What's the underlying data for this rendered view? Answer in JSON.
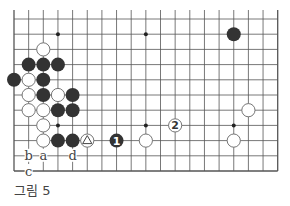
{
  "figure": {
    "caption": "그림 5",
    "board": {
      "columns": 19,
      "rows": 11,
      "edges": [
        "left",
        "bottom",
        "right"
      ],
      "line_color": "#555555",
      "black_color": "#333333",
      "white_fill": "#ffffff",
      "star_points": [
        [
          3,
          1
        ],
        [
          9,
          1
        ],
        [
          3,
          7
        ],
        [
          9,
          7
        ],
        [
          15,
          7
        ]
      ],
      "stones": [
        {
          "col": 2,
          "row": 2,
          "color": "white"
        },
        {
          "col": 1,
          "row": 3,
          "color": "black"
        },
        {
          "col": 2,
          "row": 3,
          "color": "black"
        },
        {
          "col": 3,
          "row": 3,
          "color": "black"
        },
        {
          "col": 0,
          "row": 4,
          "color": "black"
        },
        {
          "col": 1,
          "row": 4,
          "color": "white"
        },
        {
          "col": 2,
          "row": 4,
          "color": "black"
        },
        {
          "col": 1,
          "row": 5,
          "color": "white"
        },
        {
          "col": 2,
          "row": 5,
          "color": "black"
        },
        {
          "col": 3,
          "row": 5,
          "color": "white"
        },
        {
          "col": 4,
          "row": 5,
          "color": "black"
        },
        {
          "col": 1,
          "row": 6,
          "color": "white"
        },
        {
          "col": 2,
          "row": 6,
          "color": "white"
        },
        {
          "col": 3,
          "row": 6,
          "color": "black"
        },
        {
          "col": 4,
          "row": 6,
          "color": "black"
        },
        {
          "col": 2,
          "row": 7,
          "color": "white"
        },
        {
          "col": 2,
          "row": 8,
          "color": "white"
        },
        {
          "col": 3,
          "row": 8,
          "color": "black"
        },
        {
          "col": 4,
          "row": 8,
          "color": "black"
        },
        {
          "col": 5,
          "row": 8,
          "color": "white",
          "mark": "triangle"
        },
        {
          "col": 7,
          "row": 8,
          "color": "black",
          "label": "1"
        },
        {
          "col": 9,
          "row": 8,
          "color": "white"
        },
        {
          "col": 11,
          "row": 7,
          "color": "white",
          "label": "2"
        },
        {
          "col": 16,
          "row": 6,
          "color": "white"
        },
        {
          "col": 15,
          "row": 8,
          "color": "white"
        },
        {
          "col": 15,
          "row": 1,
          "color": "black"
        }
      ],
      "letters": [
        {
          "col": 1,
          "row": 9,
          "text": "b"
        },
        {
          "col": 2,
          "row": 9,
          "text": "a"
        },
        {
          "col": 4,
          "row": 9,
          "text": "d"
        },
        {
          "col": 1,
          "row": 10,
          "text": "c"
        }
      ]
    }
  }
}
